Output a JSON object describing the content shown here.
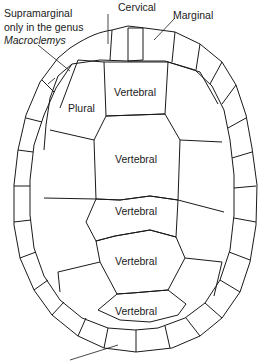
{
  "diagram": {
    "labels": {
      "cervical": "Cervical",
      "marginal": "Marginal",
      "supramarginal_line1": "Supramarginal",
      "supramarginal_line2": "only in the genus",
      "supramarginal_line3": "Macroclemys",
      "plural": "Plural",
      "vertebral_1": "Vertebral",
      "vertebral_2": "Vertebral",
      "vertebral_3": "Vertebral",
      "vertebral_4": "Vertebral",
      "vertebral_5": "Vertebral"
    },
    "colors": {
      "line": "#1a1a1a",
      "background": "#ffffff"
    }
  }
}
